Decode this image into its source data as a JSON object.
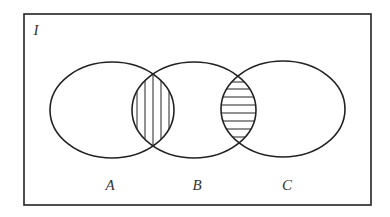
{
  "diagram": {
    "type": "venn",
    "universe": {
      "label": "I",
      "rect": {
        "x": 24,
        "y": 14,
        "width": 347,
        "height": 191
      }
    },
    "sets": [
      {
        "id": "A",
        "label": "A",
        "cx": 112,
        "cy": 110,
        "rx": 62,
        "ry": 48,
        "label_pos": {
          "x": 110,
          "y": 185
        }
      },
      {
        "id": "B",
        "label": "B",
        "cx": 194,
        "cy": 110,
        "rx": 62,
        "ry": 48,
        "label_pos": {
          "x": 197,
          "y": 185
        }
      },
      {
        "id": "C",
        "label": "C",
        "cx": 283,
        "cy": 109,
        "rx": 62,
        "ry": 48,
        "label_pos": {
          "x": 287,
          "y": 185
        }
      }
    ],
    "shaded_regions": [
      {
        "region": "A∩B",
        "pattern": "vertical-hatch"
      },
      {
        "region": "B∩C",
        "pattern": "horizontal-hatch"
      }
    ],
    "colors": {
      "stroke": "#222222",
      "background": "#ffffff",
      "label": "#333333"
    }
  }
}
